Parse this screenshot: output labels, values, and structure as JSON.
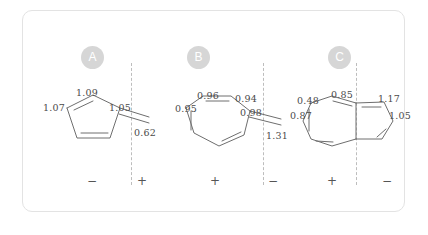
{
  "card": {
    "background": "#ffffff",
    "border_color": "#e3e3e3"
  },
  "colors": {
    "badge_fill": "#d6d6d6",
    "badge_text": "#ffffff",
    "bond_stroke": "#6e6e6e",
    "label_text": "#4a4a4a",
    "divider": "#bdbdbd"
  },
  "panels": [
    {
      "badge": "A",
      "molecule": "fulvene-cyclopentadiene-ring",
      "labels": [
        {
          "text": "1.09",
          "x": 53,
          "y": 76
        },
        {
          "text": "1.07",
          "x": 20,
          "y": 91
        },
        {
          "text": "1.05",
          "x": 86,
          "y": 91
        },
        {
          "text": "0.62",
          "x": 111,
          "y": 116
        }
      ],
      "signs": [
        {
          "text": "−",
          "x": 62,
          "y": 163
        },
        {
          "text": "+",
          "x": 112,
          "y": 163
        }
      ],
      "divider_x": 108
    },
    {
      "badge": "B",
      "molecule": "heptafulvene-cycloheptatriene-ring",
      "labels": [
        {
          "text": "0.96",
          "x": 44,
          "y": 79
        },
        {
          "text": "0.94",
          "x": 82,
          "y": 82
        },
        {
          "text": "0.95",
          "x": 22,
          "y": 92
        },
        {
          "text": "0.98",
          "x": 87,
          "y": 96
        },
        {
          "text": "1.31",
          "x": 113,
          "y": 119
        }
      ],
      "signs": [
        {
          "text": "+",
          "x": 55,
          "y": 163
        },
        {
          "text": "−",
          "x": 113,
          "y": 163
        }
      ],
      "divider_x": 110
    },
    {
      "badge": "C",
      "molecule": "azulene-fused-bicyclic",
      "labels": [
        {
          "text": "0.48",
          "x": 12,
          "y": 84
        },
        {
          "text": "0.85",
          "x": 46,
          "y": 78
        },
        {
          "text": "1.17",
          "x": 93,
          "y": 82
        },
        {
          "text": "0.87",
          "x": 5,
          "y": 99
        },
        {
          "text": "1.05",
          "x": 104,
          "y": 99
        }
      ],
      "signs": [
        {
          "text": "+",
          "x": 40,
          "y": 163
        },
        {
          "text": "−",
          "x": 95,
          "y": 163
        }
      ],
      "divider_x": 71
    }
  ]
}
